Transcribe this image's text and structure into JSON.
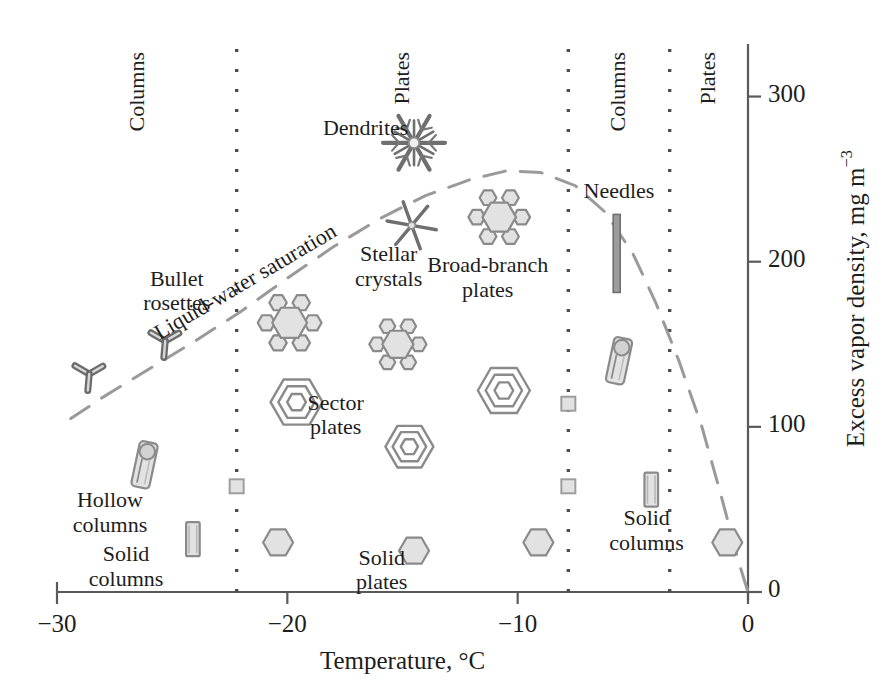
{
  "figure": {
    "kind": "snow-crystal-morphology-diagram",
    "x_axis": {
      "title": "Temperature, °C",
      "ticks": [
        {
          "value": -30,
          "label": "−30"
        },
        {
          "value": -20,
          "label": "−20"
        },
        {
          "value": -10,
          "label": "−10"
        },
        {
          "value": 0,
          "label": "0"
        }
      ],
      "range": [
        -30,
        0
      ]
    },
    "y_axis": {
      "title_main": "Excess vapor density, mg m",
      "title_exponent": "−3",
      "ticks": [
        {
          "value": 0,
          "label": "0"
        },
        {
          "value": 100,
          "label": "100"
        },
        {
          "value": 200,
          "label": "200"
        },
        {
          "value": 300,
          "label": "300"
        }
      ],
      "range": [
        0,
        330
      ]
    },
    "region_dividers_c": [
      -22.2,
      -7.8,
      -3.4
    ],
    "region_labels": [
      {
        "text": "Columns",
        "x_c": -26.5
      },
      {
        "text": "Plates",
        "x_c": -15.0
      },
      {
        "text": "Columns",
        "x_c": -5.6
      },
      {
        "text": "Plates",
        "x_c": -1.7
      }
    ],
    "saturation_curve": {
      "label": "Liquid-water saturation",
      "style": "dashed",
      "points_c_mgm3": [
        [
          -29.4,
          105
        ],
        [
          -28.0,
          118
        ],
        [
          -26.0,
          135
        ],
        [
          -24.0,
          152
        ],
        [
          -22.0,
          170
        ],
        [
          -20.0,
          190
        ],
        [
          -18.0,
          209
        ],
        [
          -16.0,
          226
        ],
        [
          -14.0,
          240
        ],
        [
          -12.0,
          250
        ],
        [
          -10.5,
          255
        ],
        [
          -9.0,
          254
        ],
        [
          -7.5,
          246
        ],
        [
          -6.2,
          230
        ],
        [
          -5.0,
          205
        ],
        [
          -4.0,
          175
        ],
        [
          -3.0,
          140
        ],
        [
          -2.0,
          100
        ],
        [
          -1.2,
          60
        ],
        [
          -0.4,
          18
        ],
        [
          0,
          0
        ]
      ]
    },
    "crystal_labels": [
      {
        "id": "dendrites",
        "lines": [
          "Dendrites"
        ],
        "x_c": -16.6,
        "y_v": 288
      },
      {
        "id": "needles",
        "lines": [
          "Needles"
        ],
        "x_c": -5.6,
        "y_v": 250
      },
      {
        "id": "stellar",
        "lines": [
          "Stellar",
          "crystals"
        ],
        "x_c": -15.6,
        "y_v": 212
      },
      {
        "id": "broad-branch",
        "lines": [
          "Broad-branch",
          "plates"
        ],
        "x_c": -11.3,
        "y_v": 205
      },
      {
        "id": "bullet-rosettes",
        "lines": [
          "Bullet",
          "rosettes"
        ],
        "x_c": -24.8,
        "y_v": 197
      },
      {
        "id": "sector-plates",
        "lines": [
          "Sector",
          "plates"
        ],
        "x_c": -17.9,
        "y_v": 122
      },
      {
        "id": "hollow-columns",
        "lines": [
          "Hollow",
          "columns"
        ],
        "x_c": -27.7,
        "y_v": 63
      },
      {
        "id": "solid-columns-l",
        "lines": [
          "Solid",
          "columns"
        ],
        "x_c": -27.0,
        "y_v": 30
      },
      {
        "id": "solid-plates",
        "lines": [
          "Solid",
          "plates"
        ],
        "x_c": -15.9,
        "y_v": 28
      },
      {
        "id": "solid-columns-r",
        "lines": [
          "Solid",
          "columns"
        ],
        "x_c": -4.4,
        "y_v": 52
      }
    ],
    "crystal_icons": [
      {
        "type": "dendrite",
        "x_c": -14.5,
        "y_v": 272,
        "size": 62
      },
      {
        "type": "star",
        "x_c": -14.6,
        "y_v": 222,
        "size": 50
      },
      {
        "type": "branched-plate",
        "x_c": -10.8,
        "y_v": 227,
        "size": 56
      },
      {
        "type": "branched-plate",
        "x_c": -19.9,
        "y_v": 163,
        "size": 58
      },
      {
        "type": "branched-plate",
        "x_c": -15.2,
        "y_v": 150,
        "size": 52
      },
      {
        "type": "bullet-rosette",
        "x_c": -25.3,
        "y_v": 152,
        "size": 30
      },
      {
        "type": "bullet-rosette",
        "x_c": -28.6,
        "y_v": 132,
        "size": 30
      },
      {
        "type": "needle",
        "x_c": -5.7,
        "y_v": 205,
        "size": 78
      },
      {
        "type": "hollow-column",
        "x_c": -5.6,
        "y_v": 140,
        "size": 46
      },
      {
        "type": "hollow-column",
        "x_c": -26.2,
        "y_v": 77,
        "size": 46
      },
      {
        "type": "sector-plate",
        "x_c": -19.6,
        "y_v": 115,
        "size": 52
      },
      {
        "type": "sector-plate",
        "x_c": -10.6,
        "y_v": 122,
        "size": 52
      },
      {
        "type": "sector-plate",
        "x_c": -14.7,
        "y_v": 88,
        "size": 48
      },
      {
        "type": "square",
        "x_c": -22.2,
        "y_v": 64,
        "size": 14
      },
      {
        "type": "square",
        "x_c": -7.8,
        "y_v": 64,
        "size": 14
      },
      {
        "type": "square",
        "x_c": -7.8,
        "y_v": 114,
        "size": 14
      },
      {
        "type": "solid-column",
        "x_c": -24.1,
        "y_v": 32,
        "size": 34
      },
      {
        "type": "solid-column",
        "x_c": -4.2,
        "y_v": 62,
        "size": 34
      },
      {
        "type": "hexagon",
        "x_c": -20.4,
        "y_v": 30,
        "size": 30
      },
      {
        "type": "hexagon",
        "x_c": -14.5,
        "y_v": 25,
        "size": 30
      },
      {
        "type": "hexagon",
        "x_c": -9.1,
        "y_v": 30,
        "size": 30
      },
      {
        "type": "hexagon",
        "x_c": -0.9,
        "y_v": 30,
        "size": 30
      }
    ],
    "colors": {
      "ink": "#1d1d1d",
      "axis": "#5a5a5a",
      "crystal_outline": "#8a8a8a",
      "crystal_fill": "#e2e2e2",
      "dashed_curve": "#9a9a9a",
      "divider": "#4d4d4d"
    }
  }
}
